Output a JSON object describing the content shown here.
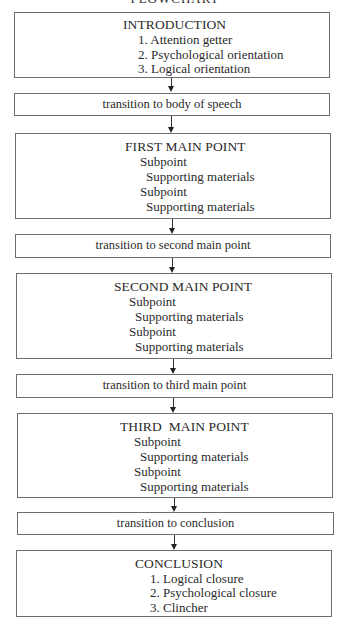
{
  "title": "FLOWCHART",
  "introduction": {
    "heading": "INTRODUCTION",
    "items": [
      "1. Attention getter",
      "2. Psychological orientation",
      "3. Logical orientation"
    ]
  },
  "transitions": [
    "transition to body of speech",
    "transition to second main point",
    "transition to third main point",
    "transition to conclusion"
  ],
  "main_points": [
    {
      "heading": "FIRST MAIN POINT",
      "lines": [
        "Subpoint",
        "Supporting materials",
        "Subpoint",
        "Supporting materials"
      ]
    },
    {
      "heading": "SECOND MAIN POINT",
      "lines": [
        "Subpoint",
        "Supporting materials",
        "Subpoint",
        "Supporting materials"
      ]
    },
    {
      "heading": "THIRD  MAIN POINT",
      "lines": [
        "Subpoint",
        "Supporting materials",
        "Subpoint",
        "Supporting materials"
      ]
    }
  ],
  "conclusion": {
    "heading": "CONCLUSION",
    "items": [
      "1. Logical closure",
      "2. Psychological closure",
      "3. Clincher"
    ]
  },
  "colors": {
    "border": "#6e6e6e",
    "text": "#2a2a2a",
    "arrow": "#222222",
    "background": "#ffffff"
  }
}
